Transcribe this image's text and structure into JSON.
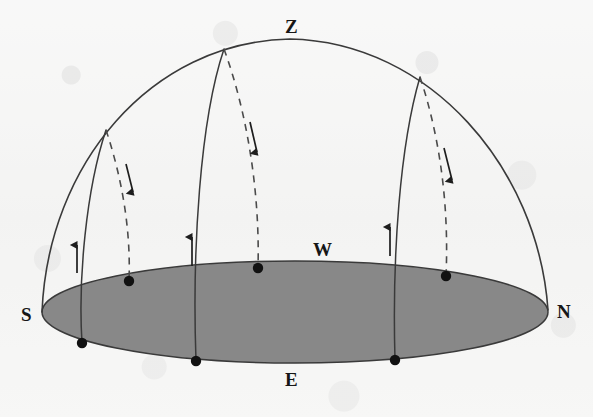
{
  "figure": {
    "type": "astronomy-diagram",
    "canvas": {
      "width": 593,
      "height": 417
    },
    "colors": {
      "background": "#f6f6f5",
      "horizon_fill": "#888888",
      "ink": "#2b2b2b",
      "label": "#161616"
    }
  },
  "labels": {
    "zenith": {
      "text": "Z",
      "x": 291,
      "y": 28
    },
    "south": {
      "text": "S",
      "x": 27,
      "y": 316
    },
    "north": {
      "text": "N",
      "x": 563,
      "y": 313
    },
    "west": {
      "text": "W",
      "x": 321,
      "y": 251
    },
    "east": {
      "text": "E",
      "x": 291,
      "y": 381
    }
  },
  "horizon": {
    "name": "horizon-plane",
    "center_x": 295,
    "center_y": 312,
    "radius_x": 253,
    "radius_y": 51,
    "fill": "#888888",
    "stroke": "#3a3a3a"
  },
  "meridian": {
    "name": "celestial-meridian-arc",
    "from": "S",
    "to": "N",
    "apex": "Z",
    "path": "M 42 312 C 48 165 150 42 290 39 C 430 42 538 168 548 310"
  },
  "star_paths": [
    {
      "id": "star-path-left",
      "rise_dot": {
        "x": 82,
        "y": 343
      },
      "set_dot": {
        "x": 129,
        "y": 281
      },
      "apex": {
        "x": 106,
        "y": 130
      },
      "rising_path": "M 82 343 C 78 280 86 190 106 130",
      "setting_path": "M 106 130 C 122 178 131 230 129 281",
      "up_arrow": {
        "x": 77,
        "y_from": 273,
        "y_to": 245
      },
      "down_arrow": {
        "x1": 126,
        "y1": 164,
        "x2": 133,
        "y2": 192
      }
    },
    {
      "id": "star-path-middle",
      "rise_dot": {
        "x": 196,
        "y": 361
      },
      "set_dot": {
        "x": 258,
        "y": 268
      },
      "apex": {
        "x": 224,
        "y": 49
      },
      "rising_path": "M 196 361 C 192 250 200 120 224 49",
      "setting_path": "M 224 49 C 248 115 260 195 258 268",
      "up_arrow": {
        "x": 192,
        "y_from": 266,
        "y_to": 237
      },
      "down_arrow": {
        "x1": 250,
        "y1": 122,
        "x2": 257,
        "y2": 152
      }
    },
    {
      "id": "star-path-right",
      "rise_dot": {
        "x": 395,
        "y": 360
      },
      "set_dot": {
        "x": 446,
        "y": 276
      },
      "apex": {
        "x": 420,
        "y": 77
      },
      "rising_path": "M 395 360 C 392 255 400 145 420 77",
      "setting_path": "M 420 77 C 441 140 449 210 446 276",
      "up_arrow": {
        "x": 390,
        "y_from": 256,
        "y_to": 227
      },
      "down_arrow": {
        "x1": 444,
        "y1": 148,
        "x2": 452,
        "y2": 180
      }
    }
  ],
  "legend_notes": {
    "solid_line": "visible rising arc above horizon",
    "dashed_line": "descending arc behind the horizon plane",
    "up_arrow": "direction of rising",
    "down_arrow": "direction of setting",
    "dot": "star position on the horizon"
  }
}
